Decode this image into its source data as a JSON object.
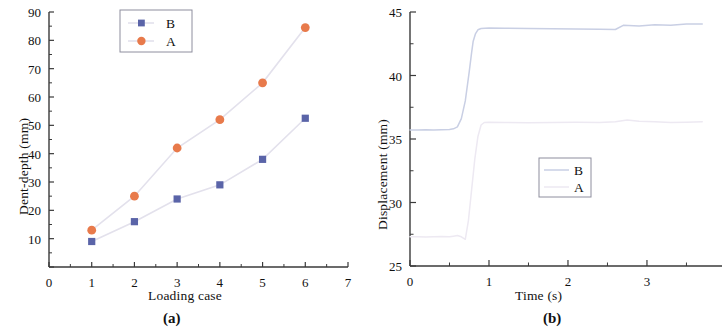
{
  "figure": {
    "panels": [
      {
        "caption": "(a)",
        "chart_key": "panel_a"
      },
      {
        "caption": "(b)",
        "chart_key": "panel_b"
      }
    ]
  },
  "colors": {
    "series_a": "#E87A4B",
    "series_b": "#5A64A8",
    "connector": "#E3E1EC",
    "axis": "#3a3a3a",
    "text": "#111111",
    "legend_border": "#8e8e9e",
    "curve_b": "#C9CFE4",
    "curve_a": "#EDE9F2"
  },
  "chart_data": [
    {
      "id": "panel_a",
      "type": "scatter",
      "title": "",
      "xlabel": "Loading case",
      "ylabel": "Dent-depth (mm)",
      "xlim": [
        0,
        7
      ],
      "ylim": [
        0,
        90
      ],
      "xticks": [
        0,
        1,
        2,
        3,
        4,
        5,
        6,
        7
      ],
      "xticklabels": [
        "0",
        "1",
        "2",
        "3",
        "4",
        "5",
        "6",
        "7"
      ],
      "yticks": [
        0,
        10,
        20,
        30,
        40,
        50,
        60,
        70,
        80,
        90
      ],
      "yticklabels": [
        "",
        "10",
        "20",
        "30",
        "40",
        "50",
        "60",
        "70",
        "80",
        "90"
      ],
      "x_minor_step": 0.5,
      "y_minor_step": 5,
      "grid": false,
      "legend_position": "top-center",
      "connect_points": true,
      "series": [
        {
          "name": "B",
          "marker": "square",
          "color": "#5A64A8",
          "x": [
            1,
            2,
            3,
            4,
            5,
            6
          ],
          "values": [
            9,
            16,
            24,
            29,
            38,
            52.5
          ]
        },
        {
          "name": "A",
          "marker": "circle",
          "color": "#E87A4B",
          "x": [
            1,
            2,
            3,
            4,
            5,
            6
          ],
          "values": [
            13,
            25,
            42,
            52,
            65,
            84.5
          ]
        }
      ]
    },
    {
      "id": "panel_b",
      "type": "line",
      "title": "",
      "xlabel": "Time (s)",
      "ylabel": "Displacement (mm)",
      "xlim": [
        0,
        3.95
      ],
      "ylim": [
        25,
        45
      ],
      "xticks": [
        0,
        1,
        2,
        3,
        4
      ],
      "xticklabels": [
        "0",
        "1",
        "2",
        "3",
        "4"
      ],
      "yticks": [
        25,
        30,
        35,
        40,
        45
      ],
      "yticklabels": [
        "25",
        "30",
        "35",
        "40",
        "45"
      ],
      "x_minor_step": 0.5,
      "y_minor_step": 2.5,
      "grid": false,
      "legend_position": "center",
      "series": [
        {
          "name": "B",
          "color": "#C9CFE4",
          "plateau_initial": 35.7,
          "plateau_final": 43.75,
          "step_start": 0.62,
          "step_end": 0.84,
          "x": [
            0,
            0.1,
            0.2,
            0.3,
            0.4,
            0.5,
            0.55,
            0.6,
            0.65,
            0.7,
            0.75,
            0.78,
            0.8,
            0.83,
            0.86,
            0.9,
            0.95,
            1.0,
            1.2,
            1.5,
            1.8,
            2.1,
            2.4,
            2.6,
            2.7,
            2.9,
            3.1,
            3.3,
            3.5,
            3.7
          ],
          "values": [
            35.7,
            35.7,
            35.72,
            35.7,
            35.73,
            35.75,
            35.8,
            35.95,
            36.6,
            38.0,
            40.3,
            41.8,
            42.7,
            43.3,
            43.6,
            43.7,
            43.72,
            43.74,
            43.72,
            43.7,
            43.68,
            43.66,
            43.64,
            43.62,
            43.95,
            43.9,
            44.0,
            43.95,
            44.05,
            44.05
          ]
        },
        {
          "name": "A",
          "color": "#EDE9F2",
          "plateau_initial": 27.3,
          "plateau_final": 36.3,
          "step_start": 0.72,
          "step_end": 0.93,
          "x": [
            0,
            0.1,
            0.2,
            0.3,
            0.4,
            0.5,
            0.55,
            0.6,
            0.65,
            0.7,
            0.74,
            0.78,
            0.82,
            0.86,
            0.9,
            0.94,
            1.0,
            1.2,
            1.5,
            1.8,
            2.1,
            2.4,
            2.6,
            2.75,
            2.9,
            3.1,
            3.3,
            3.5,
            3.7
          ],
          "values": [
            27.3,
            27.3,
            27.28,
            27.3,
            27.32,
            27.3,
            27.35,
            27.4,
            27.3,
            27.1,
            28.6,
            31.0,
            33.4,
            35.2,
            36.1,
            36.3,
            36.32,
            36.3,
            36.28,
            36.3,
            36.32,
            36.3,
            36.35,
            36.5,
            36.4,
            36.35,
            36.3,
            36.32,
            36.35
          ]
        }
      ]
    }
  ]
}
